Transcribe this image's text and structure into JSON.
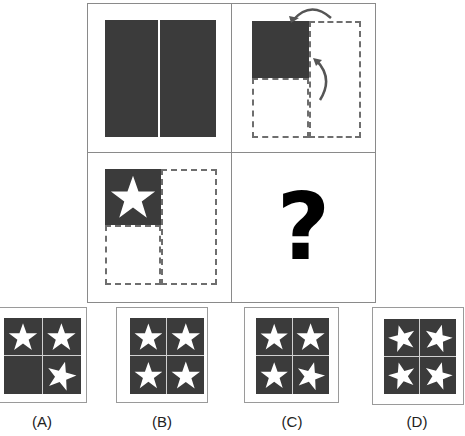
{
  "question_mark": "?",
  "colors": {
    "dark_fill": "#3b3b3b",
    "dashed_border": "#6e6e6e",
    "star": "#ffffff",
    "grid_line": "#8a8a8a"
  },
  "panels": [
    {
      "id": 1,
      "description": "dark square split vertically into two halves"
    },
    {
      "id": 2,
      "description": "dark top-left quarter, dashed empty bottom-left quarter and dashed empty right half, with curved arrows indicating folding"
    },
    {
      "id": 3,
      "description": "dark top-left quarter containing white star, dashed empty bottom-left and right half"
    },
    {
      "id": 4,
      "description": "question mark"
    }
  ],
  "options": [
    {
      "label": "(A)",
      "stars": [
        true,
        true,
        false,
        true
      ]
    },
    {
      "label": "(B)",
      "stars": [
        true,
        true,
        true,
        true
      ]
    },
    {
      "label": "(C)",
      "stars": [
        true,
        true,
        true,
        true
      ]
    },
    {
      "label": "(D)",
      "stars": [
        true,
        true,
        true,
        true
      ]
    }
  ]
}
